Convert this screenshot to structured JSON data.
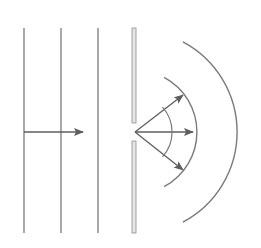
{
  "diagram": {
    "colors": {
      "line": "#7a7a7a",
      "arrow": "#5e5e5e",
      "barrier_fill": "#e4e4e4",
      "barrier_edge": "#9a9a9a",
      "background": "#ffffff"
    },
    "incident_wavefronts": [
      {
        "x": 24,
        "y1": 28,
        "y2": 233
      },
      {
        "x": 61,
        "y1": 28,
        "y2": 233
      },
      {
        "x": 98,
        "y1": 28,
        "y2": 233
      }
    ],
    "incident_arrow": {
      "x1": 24,
      "y1": 132,
      "x2": 83,
      "y2": 132
    },
    "barrier": {
      "x": 132,
      "width": 4,
      "upper": {
        "y1": 28,
        "y2": 123
      },
      "lower": {
        "y1": 141,
        "y2": 233
      }
    },
    "slit_source": {
      "x": 135,
      "y": 132
    },
    "diffracted_arrows": [
      {
        "x2": 183,
        "y2": 95
      },
      {
        "x2": 193,
        "y2": 132
      },
      {
        "x2": 183,
        "y2": 170
      }
    ],
    "angle_arc": {
      "radius": 37,
      "start_deg": -42,
      "end_deg": 42
    },
    "diffracted_wavefronts": [
      {
        "radius": 62,
        "start_deg": -62,
        "end_deg": 62
      },
      {
        "radius": 102,
        "start_deg": -62,
        "end_deg": 62
      }
    ]
  }
}
